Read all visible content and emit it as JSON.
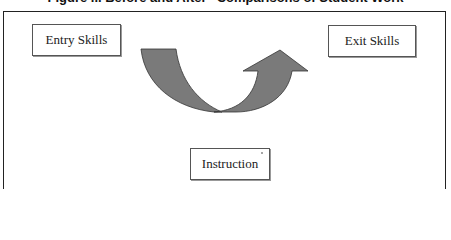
{
  "figure": {
    "title": "Figure ... Before and After” Comparisons of Student Work"
  },
  "diagram": {
    "nodes": [
      {
        "id": "entry",
        "label": "Entry Skills"
      },
      {
        "id": "exit",
        "label": "Exit Skills"
      },
      {
        "id": "instruction",
        "label": "Instruction"
      }
    ],
    "edges": [
      {
        "from": "entry",
        "to": "exit",
        "via": "instruction",
        "shape": "u-curved-arrow"
      }
    ],
    "colors": {
      "arrow_fill": "#7a7a7a",
      "arrow_stroke": "#333333",
      "frame": "#222222",
      "box_border": "#555555"
    }
  }
}
